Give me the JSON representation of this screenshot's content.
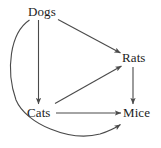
{
  "diagram": {
    "type": "directed-graph",
    "title": "",
    "background_color": "#ffffff",
    "edge_color": "#4a4a4a",
    "label_color": "#1c1c1c",
    "nodes": [
      {
        "id": "dogs",
        "label": "Dogs",
        "x": 45,
        "y": 12
      },
      {
        "id": "rats",
        "label": "Rats",
        "x": 134,
        "y": 58
      },
      {
        "id": "cats",
        "label": "Cats",
        "x": 40,
        "y": 113
      },
      {
        "id": "mice",
        "label": "Mice",
        "x": 137,
        "y": 113
      }
    ],
    "edges": [
      {
        "id": "dogs-cats",
        "from": "Dogs",
        "to": "Cats",
        "shape": "straight",
        "arrow": true
      },
      {
        "id": "dogs-rats",
        "from": "Dogs",
        "to": "Rats",
        "shape": "straight",
        "arrow": true
      },
      {
        "id": "dogs-mice",
        "from": "Dogs",
        "to": "Mice",
        "shape": "curved",
        "arrow": true
      },
      {
        "id": "cats-rats",
        "from": "Cats",
        "to": "Rats",
        "shape": "straight",
        "arrow": true
      },
      {
        "id": "cats-mice",
        "from": "Cats",
        "to": "Mice",
        "shape": "straight",
        "arrow": true
      },
      {
        "id": "rats-mice",
        "from": "Rats",
        "to": "Mice",
        "shape": "straight",
        "arrow": true
      }
    ]
  }
}
